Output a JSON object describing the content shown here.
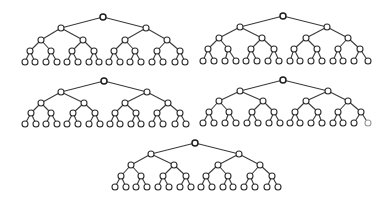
{
  "figure": {
    "node_radius": 3,
    "colors": {
      "edge": "#3a3a3a",
      "node_stroke": "#2e2e2e",
      "node_fill": "#ffffff",
      "light_node": "#9a9a9a"
    },
    "trees": [
      {
        "id": "tree-1",
        "levels": [
          {
            "y": 17,
            "x": [
              103
            ]
          },
          {
            "y": 28,
            "x": [
              61,
              146
            ]
          },
          {
            "y": 40,
            "x": [
              41,
              83,
              125,
              167
            ]
          },
          {
            "y": 51,
            "x": [
              30,
              51,
              72,
              94,
              114,
              135,
              157,
              180
            ]
          },
          {
            "y": 62,
            "x": [
              25,
              35,
              46,
              57,
              67,
              78,
              89,
              99,
              109,
              120,
              130,
              141,
              152,
              163,
              175,
              185
            ]
          }
        ],
        "light_leaves": []
      },
      {
        "id": "tree-2",
        "levels": [
          {
            "y": 16,
            "x": [
              283
            ]
          },
          {
            "y": 27,
            "x": [
              240,
              327
            ]
          },
          {
            "y": 38,
            "x": [
              219,
              262,
              306,
              348
            ]
          },
          {
            "y": 49,
            "x": [
              208,
              228,
              251,
              274,
              294,
              317,
              338,
              360
            ]
          },
          {
            "y": 61,
            "x": [
              203,
              214,
              225,
              236,
              246,
              257,
              268,
              279,
              290,
              300,
              311,
              322,
              333,
              343,
              354,
              368
            ]
          }
        ],
        "light_leaves": []
      },
      {
        "id": "tree-3",
        "levels": [
          {
            "y": 81,
            "x": [
              104
            ]
          },
          {
            "y": 92,
            "x": [
              61,
              147
            ]
          },
          {
            "y": 103,
            "x": [
              41,
              84,
              125,
              168
            ]
          },
          {
            "y": 113,
            "x": [
              31,
              51,
              73,
              95,
              115,
              136,
              157,
              180
            ]
          },
          {
            "y": 124,
            "x": [
              25,
              36,
              46,
              57,
              67,
              78,
              89,
              100,
              110,
              120,
              131,
              141,
              152,
              163,
              175,
              186
            ]
          }
        ],
        "light_leaves": []
      },
      {
        "id": "tree-4",
        "levels": [
          {
            "y": 80,
            "x": [
              283
            ]
          },
          {
            "y": 91,
            "x": [
              240,
              328
            ]
          },
          {
            "y": 101,
            "x": [
              219,
              263,
              306,
              348
            ]
          },
          {
            "y": 112,
            "x": [
              209,
              229,
              252,
              274,
              295,
              318,
              338,
              361
            ]
          },
          {
            "y": 123,
            "x": [
              203,
              214,
              225,
              236,
              247,
              258,
              269,
              280,
              290,
              300,
              311,
              322,
              333,
              343,
              354,
              368
            ]
          }
        ],
        "light_leaves": [
          15
        ]
      },
      {
        "id": "tree-5",
        "levels": [
          {
            "y": 143,
            "x": [
              195
            ]
          },
          {
            "y": 154,
            "x": [
              151,
              239
            ]
          },
          {
            "y": 165,
            "x": [
              131,
              174,
              218,
              260
            ]
          },
          {
            "y": 176,
            "x": [
              121,
              141,
              163,
              186,
              206,
              228,
              250,
              272
            ]
          },
          {
            "y": 187,
            "x": [
              115,
              126,
              136,
              147,
              158,
              169,
              180,
              191,
              201,
              212,
              223,
              233,
              244,
              255,
              267,
              278
            ]
          }
        ],
        "light_leaves": []
      }
    ]
  }
}
